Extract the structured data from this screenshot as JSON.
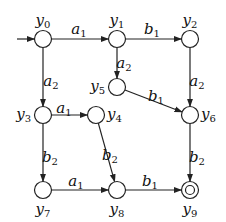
{
  "diagram": {
    "type": "finite-automaton",
    "start_state": "y0",
    "accept_states": [
      "y9"
    ],
    "nodes": [
      {
        "id": "y0",
        "base": "y",
        "sub": "0",
        "x": 43,
        "y": 39,
        "label_pos": "top"
      },
      {
        "id": "y1",
        "base": "y",
        "sub": "1",
        "x": 117,
        "y": 39,
        "label_pos": "top"
      },
      {
        "id": "y2",
        "base": "y",
        "sub": "2",
        "x": 190,
        "y": 39,
        "label_pos": "top"
      },
      {
        "id": "y3",
        "base": "y",
        "sub": "3",
        "x": 43,
        "y": 115,
        "label_pos": "left"
      },
      {
        "id": "y4",
        "base": "y",
        "sub": "4",
        "x": 96,
        "y": 115,
        "label_pos": "right"
      },
      {
        "id": "y5",
        "base": "y",
        "sub": "5",
        "x": 117,
        "y": 87,
        "label_pos": "left"
      },
      {
        "id": "y6",
        "base": "y",
        "sub": "6",
        "x": 190,
        "y": 115,
        "label_pos": "right"
      },
      {
        "id": "y7",
        "base": "y",
        "sub": "7",
        "x": 43,
        "y": 190,
        "label_pos": "bottom"
      },
      {
        "id": "y8",
        "base": "y",
        "sub": "8",
        "x": 117,
        "y": 190,
        "label_pos": "bottom"
      },
      {
        "id": "y9",
        "base": "y",
        "sub": "9",
        "x": 190,
        "y": 190,
        "label_pos": "bottom",
        "accepting": true
      }
    ],
    "edges": [
      {
        "from": "y0",
        "to": "y1",
        "base": "a",
        "sub": "1",
        "lx": 79,
        "ly": 29
      },
      {
        "from": "y1",
        "to": "y2",
        "base": "b",
        "sub": "1",
        "lx": 152,
        "ly": 29
      },
      {
        "from": "y0",
        "to": "y3",
        "base": "a",
        "sub": "2",
        "lx": 51,
        "ly": 81
      },
      {
        "from": "y1",
        "to": "y5",
        "base": "a",
        "sub": "2",
        "lx": 124,
        "ly": 63
      },
      {
        "from": "y2",
        "to": "y6",
        "base": "a",
        "sub": "2",
        "lx": 197,
        "ly": 81
      },
      {
        "from": "y5",
        "to": "y6",
        "base": "b",
        "sub": "1",
        "lx": 156,
        "ly": 96
      },
      {
        "from": "y3",
        "to": "y4",
        "base": "a",
        "sub": "1",
        "lx": 64,
        "ly": 108
      },
      {
        "from": "y3",
        "to": "y7",
        "base": "b",
        "sub": "2",
        "lx": 50,
        "ly": 157
      },
      {
        "from": "y4",
        "to": "y8",
        "base": "b",
        "sub": "2",
        "lx": 110,
        "ly": 155
      },
      {
        "from": "y6",
        "to": "y9",
        "base": "b",
        "sub": "2",
        "lx": 197,
        "ly": 157
      },
      {
        "from": "y7",
        "to": "y8",
        "base": "a",
        "sub": "1",
        "lx": 76,
        "ly": 181
      },
      {
        "from": "y8",
        "to": "y9",
        "base": "b",
        "sub": "1",
        "lx": 150,
        "ly": 181
      }
    ],
    "colors": {
      "stroke": "#222222",
      "text": "#111111",
      "background": "#ffffff"
    }
  }
}
